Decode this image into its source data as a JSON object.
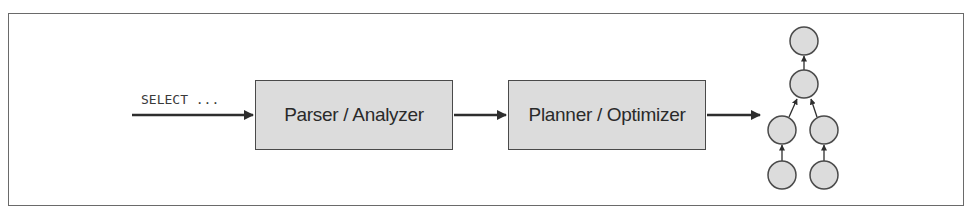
{
  "diagram": {
    "input_label": "SELECT ...",
    "stages": [
      {
        "label": "Parser / Analyzer"
      },
      {
        "label": "Planner / Optimizer"
      }
    ],
    "output": {
      "type": "tree",
      "nodes": [
        "root",
        "mid",
        "left",
        "right",
        "left-leaf",
        "right-leaf"
      ],
      "edges": [
        [
          "mid",
          "root"
        ],
        [
          "left",
          "mid"
        ],
        [
          "right",
          "mid"
        ],
        [
          "left-leaf",
          "left"
        ],
        [
          "right-leaf",
          "right"
        ]
      ]
    },
    "colors": {
      "box_fill": "#dcdcdc",
      "stroke": "#2e2e2e",
      "node_fill": "#dcdcdc"
    }
  }
}
